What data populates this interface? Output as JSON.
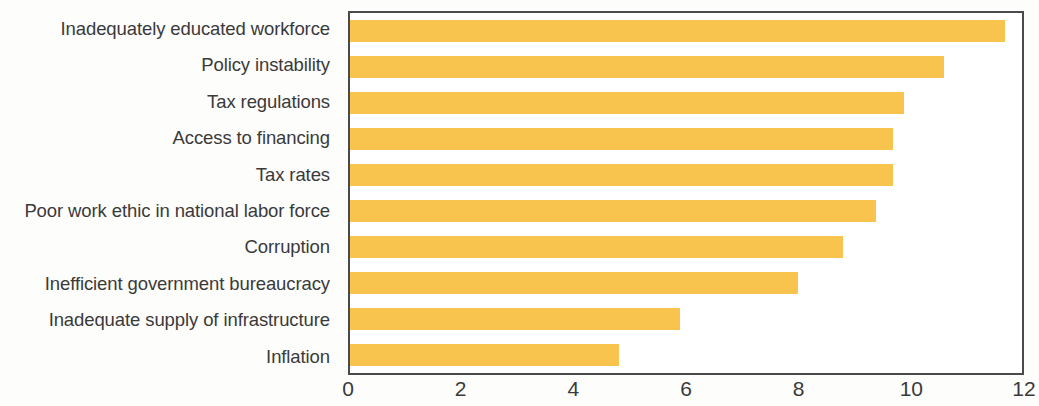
{
  "chart_data": {
    "type": "bar",
    "orientation": "horizontal",
    "title": "",
    "subtitle": "",
    "xlabel": "",
    "ylabel": "",
    "xlim": [
      0,
      12
    ],
    "xticks": [
      0,
      2,
      4,
      6,
      8,
      10,
      12
    ],
    "xtick_labels": [
      "0",
      "2",
      "4",
      "6",
      "8",
      "10",
      "12"
    ],
    "grid": false,
    "legend": false,
    "bar_color": "#f8c44e",
    "axis_color": "#4a4a4a",
    "text_color": "#3a3a3a",
    "categories": [
      "Inadequately educated workforce",
      "Policy instability",
      "Tax regulations",
      "Access to financing",
      "Tax rates",
      "Poor work ethic in national labor force",
      "Corruption",
      "Inefficient government bureaucracy",
      "Inadequate supply of infrastructure",
      "Inflation"
    ],
    "values": [
      11.7,
      10.6,
      9.9,
      9.7,
      9.7,
      9.4,
      8.8,
      8.0,
      5.9,
      4.8
    ]
  }
}
